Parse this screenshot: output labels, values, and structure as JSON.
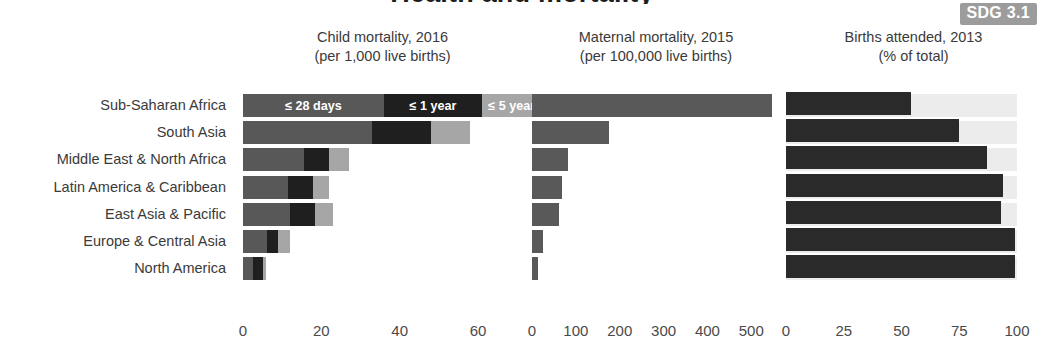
{
  "figure": {
    "cut_off_title": "Health and mortality",
    "badge": "SDG 3.1"
  },
  "panels": [
    {
      "id": "child-mortality",
      "title_line1": "Child mortality, 2016",
      "title_line2": "(per 1,000 live births)"
    },
    {
      "id": "maternal-mortality",
      "title_line1": "Maternal mortality, 2015",
      "title_line2": "(per 100,000 live births)"
    },
    {
      "id": "births-attended",
      "title_line1": "Births attended, 2013",
      "title_line2": "(% of total)"
    }
  ],
  "regions": [
    "Sub-Saharan Africa",
    "South Asia",
    "Middle East & North Africa",
    "Latin America & Caribbean",
    "East Asia & Pacific",
    "Europe & Central Asia",
    "North America"
  ],
  "legend": {
    "neonatal": "≤ 28 days",
    "infant": "≤ 1 year",
    "under_five": "≤ 5 years"
  },
  "colors": {
    "neonatal": "#585858",
    "infant": "#1f1f1f",
    "under_five": "#a6a6a6",
    "maternal_bar": "#595959",
    "attended_bar": "#2a2a2a",
    "attended_track": "#ececec",
    "badge_bg": "#9c9c9c",
    "text": "#3a3a3a"
  },
  "chart_data": [
    {
      "type": "bar",
      "orientation": "horizontal",
      "stacked": true,
      "title": "Child mortality, 2016",
      "subtitle": "(per 1,000 live births)",
      "xlabel": "",
      "ylabel": "",
      "xlim": [
        0,
        72
      ],
      "xticks": [
        0,
        20,
        40,
        60
      ],
      "xticklabels": [
        "0",
        "20",
        "40",
        "60"
      ],
      "grid": false,
      "legend": [
        "≤ 28 days",
        "≤ 1 year",
        "≤ 5 years"
      ],
      "legend_position": "in-first-bar",
      "categories": [
        "Sub-Saharan Africa",
        "South Asia",
        "Middle East & North Africa",
        "Latin America & Caribbean",
        "East Asia & Pacific",
        "Europe & Central Asia",
        "North America"
      ],
      "series": [
        {
          "name": "≤ 28 days",
          "values": [
            36,
            33,
            15.5,
            11.5,
            12,
            6,
            2.5
          ]
        },
        {
          "name": "≤ 1 year",
          "values": [
            25,
            15,
            6.5,
            6.5,
            6.5,
            3,
            2.5
          ]
        },
        {
          "name": "≤ 5 years",
          "values": [
            17,
            10,
            5,
            4,
            4.5,
            3,
            1
          ]
        }
      ],
      "totals": [
        78,
        58,
        27,
        22,
        23,
        12,
        6
      ]
    },
    {
      "type": "bar",
      "orientation": "horizontal",
      "stacked": false,
      "title": "Maternal mortality, 2015",
      "subtitle": "(per 100,000 live births)",
      "xlabel": "",
      "ylabel": "",
      "xlim": [
        0,
        570
      ],
      "xticks": [
        0,
        100,
        200,
        300,
        400,
        500
      ],
      "xticklabels": [
        "0",
        "100",
        "200",
        "300",
        "400",
        "500"
      ],
      "grid": false,
      "categories": [
        "Sub-Saharan Africa",
        "South Asia",
        "Middle East & North Africa",
        "Latin America & Caribbean",
        "East Asia & Pacific",
        "Europe & Central Asia",
        "North America"
      ],
      "values": [
        547,
        176,
        81,
        68,
        62,
        25,
        13
      ]
    },
    {
      "type": "bar",
      "orientation": "horizontal",
      "stacked": false,
      "title": "Births attended, 2013",
      "subtitle": "(% of total)",
      "xlabel": "",
      "ylabel": "",
      "xlim": [
        0,
        100
      ],
      "xticks": [
        0,
        25,
        50,
        75,
        100
      ],
      "xticklabels": [
        "0",
        "25",
        "50",
        "75",
        "100"
      ],
      "grid": false,
      "categories": [
        "Sub-Saharan Africa",
        "South Asia",
        "Middle East & North Africa",
        "Latin America & Caribbean",
        "East Asia & Pacific",
        "Europe & Central Asia",
        "North America"
      ],
      "values": [
        54,
        75,
        87,
        94,
        93,
        99,
        99
      ]
    }
  ]
}
